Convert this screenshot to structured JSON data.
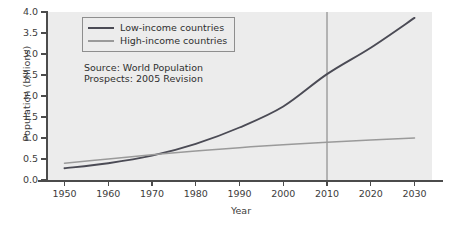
{
  "chart_data": {
    "type": "line",
    "title": "",
    "xlabel": "Year",
    "ylabel": "Population (billions)",
    "xlim": [
      1946,
      2034
    ],
    "ylim": [
      0.0,
      4.0
    ],
    "grid": false,
    "legend_position": "upper left",
    "background_color": "#ececec",
    "x": [
      1950,
      1960,
      1970,
      1980,
      1990,
      2000,
      2010,
      2020,
      2030
    ],
    "xticklabels": [
      "1950",
      "1960",
      "1970",
      "1980",
      "1990",
      "2000",
      "2010",
      "2020",
      "2030"
    ],
    "yticks": [
      0.0,
      0.5,
      1.0,
      1.5,
      2.0,
      2.5,
      3.0,
      3.5,
      4.0
    ],
    "yticklabels": [
      "0.0",
      "0.5",
      "1.0",
      "1.5",
      "2.0",
      "2.5",
      "3.0",
      "3.5",
      "4.0"
    ],
    "series": [
      {
        "name": "Low-income countries",
        "color": "#4b4b55",
        "values": [
          0.28,
          0.4,
          0.58,
          0.86,
          1.25,
          1.75,
          2.52,
          3.15,
          3.86
        ]
      },
      {
        "name": "High-income countries",
        "color": "#9a9a9a",
        "values": [
          0.4,
          0.5,
          0.6,
          0.69,
          0.77,
          0.84,
          0.9,
          0.95,
          1.0
        ]
      }
    ],
    "annotations": [
      {
        "name": "source-note",
        "text_line1": "Source: World Population",
        "text_line2": "Prospects: 2005 Revision"
      }
    ],
    "reference_lines": [
      {
        "name": "year-2010-marker",
        "orientation": "vertical",
        "value": 2010,
        "color": "#6e6e6e"
      }
    ]
  },
  "legend": {
    "items": [
      {
        "label": "Low-income countries",
        "color": "#4b4b55"
      },
      {
        "label": "High-income countries",
        "color": "#9a9a9a"
      }
    ]
  },
  "axes": {
    "ylabel": "Population (billions)",
    "xlabel": "Year"
  },
  "source_note": {
    "line1": "Source: World Population",
    "line2": "Prospects: 2005 Revision"
  }
}
